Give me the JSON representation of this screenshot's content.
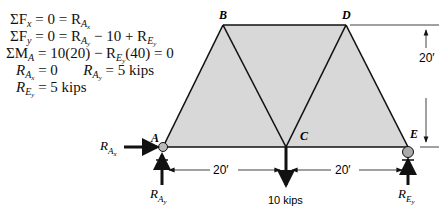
{
  "equations": {
    "line1": {
      "lhs": "ΣF",
      "lhs_sub": "x",
      "mid": " = 0 = R",
      "r_sub": "A",
      "r_subsub": "x",
      "rest": ""
    },
    "line2": {
      "lhs": "ΣF",
      "lhs_sub": "y",
      "mid": " = 0 = R",
      "r_sub": "A",
      "r_subsub": "y",
      "rest": " − 10 + R",
      "r2_sub": "E",
      "r2_subsub": "y"
    },
    "line3": {
      "lhs": "ΣM",
      "lhs_sub": "A",
      "mid": " = 10(20) − R",
      "r_sub": "E",
      "r_subsub": "y",
      "rest": "(40) = 0"
    },
    "line4": {
      "a": "R",
      "a_sub": "A",
      "a_subsub": "x",
      "a_val": " = 0",
      "b": "R",
      "b_sub": "A",
      "b_subsub": "y",
      "b_val": " = 5 kips"
    },
    "line5": {
      "a": "R",
      "a_sub": "E",
      "a_subsub": "y",
      "a_val": " = 5 kips"
    }
  },
  "truss": {
    "nodes": {
      "A": "A",
      "B": "B",
      "C": "C",
      "D": "D",
      "E": "E"
    },
    "fill_color": "#d9d9d9",
    "member_color": "#111111"
  },
  "dimensions": {
    "span_AC": "20′",
    "span_CE": "20′",
    "height": "20′"
  },
  "loads": {
    "C_load": "10 kips"
  },
  "reactions": {
    "RAx": {
      "main": "R",
      "sub": "A",
      "subsub": "x"
    },
    "RAy": {
      "main": "R",
      "sub": "A",
      "subsub": "y"
    },
    "REy": {
      "main": "R",
      "sub": "E",
      "subsub": "y"
    }
  }
}
